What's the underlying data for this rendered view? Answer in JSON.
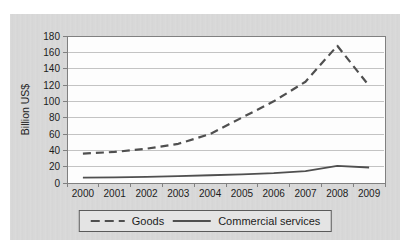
{
  "chart_data": {
    "type": "line",
    "title": "",
    "xlabel": "",
    "ylabel": "Billion US$",
    "categories": [
      "2000",
      "2001",
      "2002",
      "2003",
      "2004",
      "2005",
      "2006",
      "2007",
      "2008",
      "2009"
    ],
    "series": [
      {
        "name": "Goods",
        "style": "dashed",
        "color": "#4f4f4f",
        "values": [
          36,
          38,
          42,
          48,
          60,
          80,
          100,
          124,
          168,
          119
        ]
      },
      {
        "name": "Commercial services",
        "style": "solid",
        "color": "#4f4f4f",
        "values": [
          6.5,
          7,
          7.5,
          8.5,
          9.5,
          10.5,
          12,
          14.5,
          21,
          19
        ]
      }
    ],
    "ylim": [
      0,
      180
    ],
    "ytick_step": 20,
    "yticks": [
      "0",
      "20",
      "40",
      "60",
      "80",
      "100",
      "120",
      "140",
      "160",
      "180"
    ],
    "grid": "horizontal",
    "legend_position": "bottom"
  },
  "colors": {
    "card_bg": "#d8d8d8",
    "plot_bg": "#fdfdfd",
    "gridline": "#c3c3c3",
    "axis": "#808080",
    "text": "#1c1c1c",
    "legend_bg": "#e4e4e4",
    "legend_border": "#5a5a5a"
  }
}
